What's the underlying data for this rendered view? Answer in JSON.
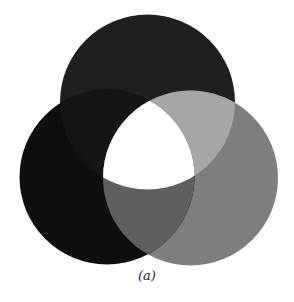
{
  "figure": {
    "caption": "(a)",
    "background": "#ffffff",
    "circles": [
      {
        "name": "top",
        "cx": 147.5,
        "cy": 102,
        "r": 87.5,
        "color": "#1f1f1f"
      },
      {
        "name": "left",
        "cx": 107,
        "cy": 177,
        "r": 87.5,
        "color": "#0e0e0e"
      },
      {
        "name": "right",
        "cx": 190.5,
        "cy": 178,
        "r": 87.5,
        "color": "#7e7e7e"
      }
    ],
    "overlap_colors": {
      "top_left": "#151515",
      "top_right": "#a6a6a6",
      "left_right": "#5f5f5f",
      "all_three": "#ffffff"
    }
  }
}
